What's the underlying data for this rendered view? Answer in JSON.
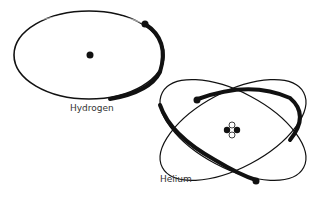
{
  "diagram": {
    "atoms": [
      {
        "name": "Hydrogen",
        "electrons": 1,
        "protons": 1
      },
      {
        "name": "Helium",
        "electrons": 2,
        "nucleons": 4
      }
    ],
    "colors": {
      "ink": "#111111",
      "label": "#333333",
      "background": "#ffffff"
    }
  }
}
